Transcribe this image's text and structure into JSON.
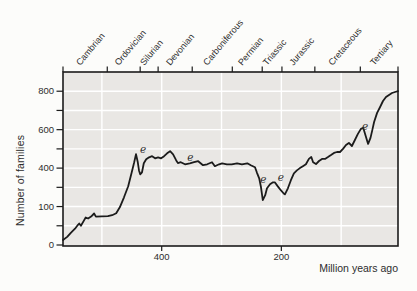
{
  "figure": {
    "background": "#fcfcfa",
    "plot_background": "#e9e7e4",
    "grid_color": "#ffffff",
    "curve_color": "#1b1b1b",
    "axis_color": "#1b1b1b",
    "text_color": "#2d2d2d"
  },
  "chart_data": {
    "type": "line",
    "xlabel": "Million years ago",
    "ylabel": "Number of families",
    "x_axis": {
      "range_mya": [
        565,
        5
      ],
      "tick_labels": [
        {
          "value": 400,
          "label": "400"
        },
        {
          "value": 200,
          "label": "200"
        }
      ],
      "gridlines_mya": [
        500,
        400,
        300,
        200,
        100
      ]
    },
    "y_axis": {
      "range": [
        0,
        900
      ],
      "tick_step": 100,
      "tick_labels": [
        {
          "value": 800,
          "label": "800"
        },
        {
          "value": 600,
          "label": "600"
        },
        {
          "value": 400,
          "label": "400"
        },
        {
          "value": 200,
          "label": "100"
        },
        {
          "value": 0,
          "label": "0"
        }
      ]
    },
    "geologic_periods": [
      {
        "name": "Cambrian",
        "from_mya": 565,
        "to_mya": 491
      },
      {
        "name": "Ordovician",
        "from_mya": 491,
        "to_mya": 436
      },
      {
        "name": "Silurian",
        "from_mya": 436,
        "to_mya": 406
      },
      {
        "name": "Devonian",
        "from_mya": 406,
        "to_mya": 349
      },
      {
        "name": "Carboniferous",
        "from_mya": 349,
        "to_mya": 282
      },
      {
        "name": "Permian",
        "from_mya": 282,
        "to_mya": 232
      },
      {
        "name": "Triassic",
        "from_mya": 232,
        "to_mya": 199
      },
      {
        "name": "Jurassic",
        "from_mya": 199,
        "to_mya": 144
      },
      {
        "name": "Cretaceous",
        "from_mya": 144,
        "to_mya": 68
      },
      {
        "name": "Tertiary",
        "from_mya": 68,
        "to_mya": 5
      }
    ],
    "series": [
      {
        "name": "Number of families",
        "points_mya_families": [
          [
            565,
            26
          ],
          [
            558,
            42
          ],
          [
            552,
            63
          ],
          [
            545,
            85
          ],
          [
            540,
            105
          ],
          [
            538,
            112
          ],
          [
            535,
            100
          ],
          [
            530,
            127
          ],
          [
            527,
            143
          ],
          [
            523,
            138
          ],
          [
            518,
            148
          ],
          [
            513,
            164
          ],
          [
            510,
            148
          ],
          [
            500,
            149
          ],
          [
            490,
            150
          ],
          [
            483,
            155
          ],
          [
            476,
            165
          ],
          [
            470,
            196
          ],
          [
            463,
            248
          ],
          [
            456,
            306
          ],
          [
            450,
            380
          ],
          [
            446,
            430
          ],
          [
            443,
            473
          ],
          [
            440,
            430
          ],
          [
            438,
            388
          ],
          [
            436,
            368
          ],
          [
            433,
            378
          ],
          [
            430,
            425
          ],
          [
            426,
            446
          ],
          [
            421,
            456
          ],
          [
            416,
            462
          ],
          [
            411,
            451
          ],
          [
            406,
            456
          ],
          [
            401,
            451
          ],
          [
            396,
            462
          ],
          [
            391,
            477
          ],
          [
            386,
            488
          ],
          [
            381,
            472
          ],
          [
            376,
            441
          ],
          [
            373,
            426
          ],
          [
            368,
            431
          ],
          [
            361,
            420
          ],
          [
            353,
            425
          ],
          [
            346,
            431
          ],
          [
            339,
            436
          ],
          [
            331,
            415
          ],
          [
            324,
            420
          ],
          [
            316,
            431
          ],
          [
            311,
            410
          ],
          [
            304,
            420
          ],
          [
            299,
            425
          ],
          [
            291,
            420
          ],
          [
            283,
            420
          ],
          [
            274,
            425
          ],
          [
            266,
            420
          ],
          [
            257,
            425
          ],
          [
            251,
            415
          ],
          [
            244,
            405
          ],
          [
            241,
            378
          ],
          [
            237,
            347
          ],
          [
            234,
            300
          ],
          [
            231,
            233
          ],
          [
            227,
            259
          ],
          [
            224,
            295
          ],
          [
            219,
            316
          ],
          [
            214,
            326
          ],
          [
            211,
            326
          ],
          [
            206,
            305
          ],
          [
            201,
            285
          ],
          [
            196,
            268
          ],
          [
            194,
            263
          ],
          [
            189,
            295
          ],
          [
            184,
            337
          ],
          [
            179,
            373
          ],
          [
            174,
            388
          ],
          [
            169,
            400
          ],
          [
            164,
            410
          ],
          [
            159,
            420
          ],
          [
            154,
            448
          ],
          [
            150,
            458
          ],
          [
            147,
            431
          ],
          [
            142,
            421
          ],
          [
            137,
            437
          ],
          [
            132,
            448
          ],
          [
            127,
            448
          ],
          [
            122,
            458
          ],
          [
            117,
            468
          ],
          [
            112,
            479
          ],
          [
            107,
            484
          ],
          [
            102,
            484
          ],
          [
            97,
            500
          ],
          [
            92,
            520
          ],
          [
            87,
            531
          ],
          [
            82,
            515
          ],
          [
            77,
            546
          ],
          [
            72,
            578
          ],
          [
            67,
            604
          ],
          [
            63,
            609
          ],
          [
            60,
            578
          ],
          [
            56,
            536
          ],
          [
            55,
            526
          ],
          [
            51,
            557
          ],
          [
            48,
            598
          ],
          [
            45,
            640
          ],
          [
            40,
            687
          ],
          [
            35,
            718
          ],
          [
            30,
            749
          ],
          [
            25,
            770
          ],
          [
            20,
            781
          ],
          [
            15,
            791
          ],
          [
            10,
            796
          ],
          [
            5,
            800
          ]
        ]
      }
    ],
    "extinction_markers": {
      "symbol": "e",
      "positions_mya_families": [
        [
          431,
          492
        ],
        [
          352,
          452
        ],
        [
          230,
          338
        ],
        [
          201,
          347
        ],
        [
          60,
          612
        ]
      ]
    }
  }
}
